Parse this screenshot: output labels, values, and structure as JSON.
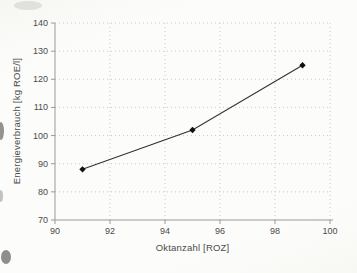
{
  "chart_data": {
    "type": "line",
    "title": "",
    "xlabel": "Oktanzahl [ROZ]",
    "ylabel": "Energieverbrauch [kg ROE/l]",
    "x": [
      91,
      95,
      99
    ],
    "series": [
      {
        "name": "Energieverbrauch",
        "values": [
          88,
          102,
          125
        ]
      }
    ],
    "xlim": [
      90,
      100
    ],
    "ylim": [
      70,
      140
    ],
    "xticks": [
      90,
      92,
      94,
      96,
      98,
      100
    ],
    "yticks": [
      70,
      80,
      90,
      100,
      110,
      120,
      130,
      140
    ],
    "grid": "dotted",
    "legend": "none",
    "marker": "diamond",
    "colors": {
      "line": "#333333",
      "marker": "#111111",
      "grid": "#c9c9c7",
      "axis": "#9a9a98",
      "text": "#4b4b4b"
    }
  }
}
